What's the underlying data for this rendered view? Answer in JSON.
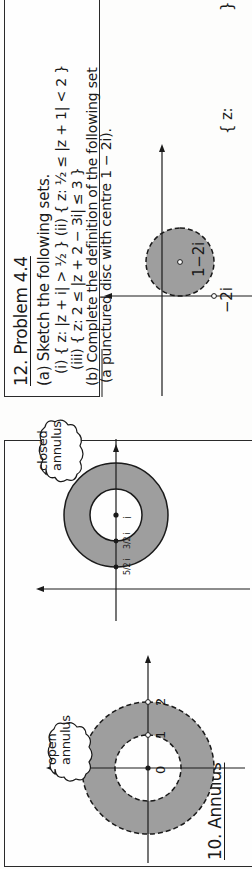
{
  "orientation": "rotated-90-ccw",
  "panels": {
    "annulus": {
      "title": "10. Annulus",
      "open": {
        "label_line1": "open",
        "label_line2": "annulus",
        "tick_0": "0",
        "tick_1": "1",
        "tick_2": "2"
      },
      "closed": {
        "label_line1": "closed",
        "label_line2": "annulus",
        "centre_label": "i",
        "inner_label": "3/2 i",
        "outer_label": "5/2 i"
      }
    },
    "problem": {
      "title": "12. Problem 4.4",
      "part_a": "(a) Sketch the following sets.",
      "part_a_i_ii": "(i) { z: |z + i| > ½ }  (ii) { z: ½ ≤ |z + 1| < 2 }",
      "part_a_iii": "(iii) { z: 2 ≤ |z + 2 − 3i| ≤ 3 }",
      "part_b": "(b) Complete the definition of the following set",
      "part_b_note": "(a punctured disc with centre 1 − 2i).",
      "disc_centre_label": "1−2i",
      "disc_point_label": "−2i",
      "set_prefix": "{ z:",
      "set_suffix": "}"
    }
  },
  "colors": {
    "shade": "#9e9e9e",
    "ink": "#1a1a1a",
    "paper": "#fdfdfc"
  }
}
